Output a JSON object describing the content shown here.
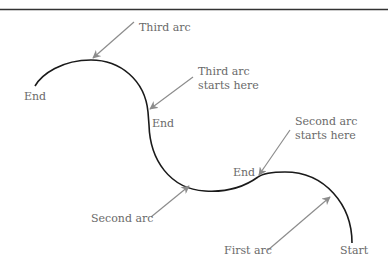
{
  "diagram": {
    "colors": {
      "curve": "#1a1a1a",
      "arrow": "#8c8c8c",
      "text": "#6a6a6a",
      "rule": "#333333"
    },
    "labels": {
      "end_left": "End",
      "third_arc": "Third arc",
      "third_arc_starts_line1": "Third arc",
      "third_arc_starts_line2": "starts here",
      "end_middle": "End",
      "second_arc_starts_line1": "Second arc",
      "second_arc_starts_line2": "starts here",
      "end_right": "End",
      "second_arc": "Second arc",
      "first_arc": "First arc",
      "start": "Start"
    },
    "arcs": [
      {
        "name": "First arc",
        "from": [
          352,
          243
        ],
        "to": [
          258,
          177
        ]
      },
      {
        "name": "Second arc",
        "from": [
          258,
          177
        ],
        "to": [
          148,
          112
        ]
      },
      {
        "name": "Third arc",
        "from": [
          148,
          112
        ],
        "to": [
          35,
          86
        ]
      }
    ]
  }
}
